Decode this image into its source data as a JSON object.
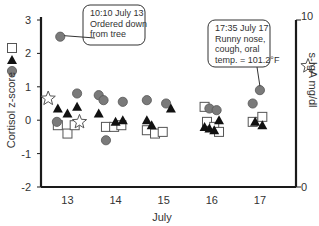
{
  "chart_data": {
    "type": "scatter",
    "title": "",
    "xlabel": "July",
    "ylabel": "Cortisol z-score",
    "y2label": "s-IgA mg/dl",
    "categories": [
      "13",
      "14",
      "15",
      "16",
      "17"
    ],
    "ylim": [
      -2,
      3
    ],
    "y2lim": [
      0,
      10
    ],
    "yticks": [
      "3",
      "2",
      "1",
      "0",
      "-1",
      "-2"
    ],
    "y2ticks": [
      "10",
      "0"
    ],
    "grid": false,
    "legend": {
      "position": "left-axis, stacked vertically beside y-label",
      "entries": [
        {
          "symbol": "open-square",
          "axis": "left"
        },
        {
          "symbol": "filled-triangle",
          "axis": "left"
        },
        {
          "symbol": "gray-circle",
          "axis": "left"
        },
        {
          "symbol": "open-star",
          "axis": "right",
          "label": "s-IgA mg/dl"
        }
      ]
    },
    "series": [
      {
        "name": "circle",
        "symbol": "gray-circle",
        "axis": "left",
        "points": [
          {
            "x": 12.85,
            "y": 2.5
          },
          {
            "x": 12.78,
            "y": -0.05
          },
          {
            "x": 13.2,
            "y": 0.8
          },
          {
            "x": 13.65,
            "y": 0.75
          },
          {
            "x": 13.75,
            "y": 0.6
          },
          {
            "x": 14.15,
            "y": 0.55
          },
          {
            "x": 13.8,
            "y": -0.6
          },
          {
            "x": 14.65,
            "y": 0.6
          },
          {
            "x": 15.05,
            "y": 0.5
          },
          {
            "x": 15.95,
            "y": 0.35
          },
          {
            "x": 16.1,
            "y": 0.3
          },
          {
            "x": 16.85,
            "y": 0.5
          },
          {
            "x": 17.0,
            "y": 0.9
          }
        ]
      },
      {
        "name": "triangle",
        "symbol": "filled-triangle",
        "axis": "left",
        "points": [
          {
            "x": 12.8,
            "y": 0.35
          },
          {
            "x": 13.0,
            "y": 0.2
          },
          {
            "x": 13.2,
            "y": 0.4
          },
          {
            "x": 13.65,
            "y": 0.2
          },
          {
            "x": 14.0,
            "y": -0.05
          },
          {
            "x": 14.15,
            "y": 0.0
          },
          {
            "x": 14.65,
            "y": 0.0
          },
          {
            "x": 14.75,
            "y": -0.15
          },
          {
            "x": 15.15,
            "y": 0.35
          },
          {
            "x": 15.85,
            "y": -0.2
          },
          {
            "x": 15.95,
            "y": -0.25
          },
          {
            "x": 16.05,
            "y": -0.3
          },
          {
            "x": 16.15,
            "y": 0.0
          },
          {
            "x": 16.9,
            "y": -0.05
          },
          {
            "x": 17.05,
            "y": -0.15
          }
        ]
      },
      {
        "name": "square",
        "symbol": "open-square",
        "axis": "left",
        "points": [
          {
            "x": 12.8,
            "y": -0.15
          },
          {
            "x": 13.0,
            "y": -0.4
          },
          {
            "x": 13.15,
            "y": -0.15
          },
          {
            "x": 13.8,
            "y": -0.2
          },
          {
            "x": 13.97,
            "y": -0.2
          },
          {
            "x": 14.12,
            "y": -0.15
          },
          {
            "x": 14.65,
            "y": -0.3
          },
          {
            "x": 14.82,
            "y": -0.4
          },
          {
            "x": 14.98,
            "y": -0.35
          },
          {
            "x": 15.85,
            "y": 0.4
          },
          {
            "x": 15.9,
            "y": -0.05
          },
          {
            "x": 16.05,
            "y": -0.2
          },
          {
            "x": 16.15,
            "y": -0.35
          },
          {
            "x": 16.85,
            "y": -0.05
          },
          {
            "x": 17.05,
            "y": 0.1
          }
        ]
      },
      {
        "name": "s-IgA",
        "symbol": "open-star",
        "axis": "right",
        "points": [
          {
            "x": 12.6,
            "y": 5.3
          },
          {
            "x": 13.25,
            "y": 3.9
          }
        ]
      }
    ],
    "annotations": [
      {
        "target": {
          "x": 12.85,
          "y": 2.5
        },
        "lines": [
          "10:10 July 13",
          "Ordered down",
          "from tree"
        ]
      },
      {
        "target": {
          "x": 17.0,
          "y": 0.9
        },
        "lines": [
          "17:35 July 17",
          "Runny nose,",
          "cough, oral",
          "temp. = 101.2°F"
        ]
      }
    ]
  },
  "colors": {
    "axis": "#1a1a1a",
    "circle_fill": "#7a7a7a",
    "circle_stroke": "#555555",
    "triangle_fill": "#111111",
    "square_stroke": "#555555",
    "star_stroke": "#555555",
    "text": "#333333"
  }
}
